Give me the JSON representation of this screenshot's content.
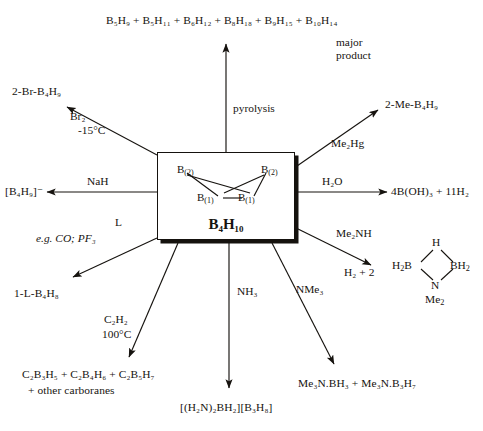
{
  "diagram": {
    "center": {
      "formula": "B₄H₁₀",
      "structure_atoms": [
        {
          "label": "B",
          "index": "(2)",
          "position": "top-left"
        },
        {
          "label": "B",
          "index": "(2)",
          "position": "top-right"
        },
        {
          "label": "B",
          "index": "(1)",
          "position": "bottom-left"
        },
        {
          "label": "B",
          "index": "(1)",
          "position": "bottom-right"
        }
      ]
    },
    "reactions": [
      {
        "id": "pyrolysis",
        "direction": "up",
        "reagent": "pyrolysis",
        "product": "B₅H₉ + B₅H₁₁ + B₆H₁₂ + B₈H₁₈ + B₉H₁₅ + B₁₀H₁₄",
        "annotation_line1": "major",
        "annotation_line2": "product"
      },
      {
        "id": "bromination",
        "direction": "up-left",
        "reagent_line1": "Br₂",
        "reagent_line2": "-15°C",
        "product": "2-Br-B₄H₉"
      },
      {
        "id": "deprotonation",
        "direction": "left",
        "reagent": "NaH",
        "product": "[B₄H₉]⁻"
      },
      {
        "id": "ligand-substitution",
        "direction": "down-left",
        "reagent_line1": "L",
        "reagent_line2": "e.g. CO; PF₃",
        "product": "1-L-B₄H₈"
      },
      {
        "id": "carborane-formation",
        "direction": "down-left",
        "reagent_line1": "C₂H₂",
        "reagent_line2": "100°C",
        "product_line1": "C₂B₃H₅ + C₂B₄H₆ + C₂B₅H₇",
        "product_line2": "+  other  carboranes"
      },
      {
        "id": "ammonia",
        "direction": "down",
        "reagent": "NH₃",
        "product": "[(H₂N)₂BH₂][B₃H₈]"
      },
      {
        "id": "trimethylamine",
        "direction": "down-right",
        "reagent": "NMe₃",
        "product": "Me₃N.BH₃ + Me₃N.B₃H₇"
      },
      {
        "id": "dimethylamine",
        "direction": "right-down",
        "reagent": "Me₂NH",
        "product_prefix": "H₂ + 2",
        "ring": {
          "top": "H",
          "left": "H₂B",
          "right": "BH₂",
          "bottom": "N",
          "below": "Me₂"
        }
      },
      {
        "id": "hydrolysis",
        "direction": "right",
        "reagent": "H₂O",
        "product": "4B(OH)₃ + 11H₂"
      },
      {
        "id": "methylation",
        "direction": "up-right",
        "reagent": "Me₂Hg",
        "product": "2-Me-B₄H₉"
      }
    ],
    "colors": {
      "ink": "#16130f",
      "background": "#ffffff"
    }
  }
}
